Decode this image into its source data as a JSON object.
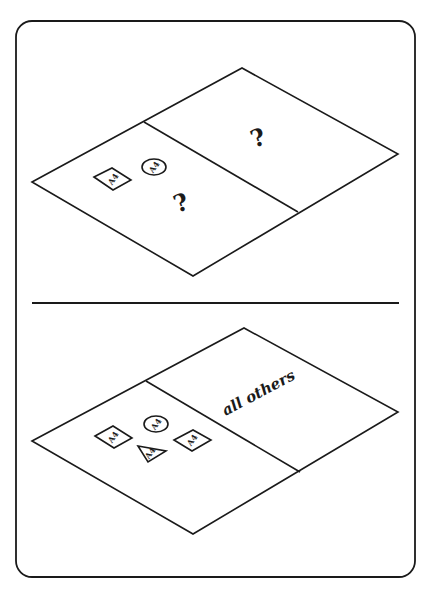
{
  "figure": {
    "colors": {
      "ink": "#1a1a1a",
      "paper": "#ffffff"
    },
    "top_panel": {
      "shape_label": "A4",
      "left_region_mark": "?",
      "right_region_mark": "?",
      "left_region_shapes": [
        "diamond",
        "circle"
      ]
    },
    "bottom_panel": {
      "shape_label": "A4",
      "right_region_text": "all others",
      "left_region_shapes": [
        "diamond",
        "circle",
        "triangle",
        "diamond"
      ]
    }
  }
}
